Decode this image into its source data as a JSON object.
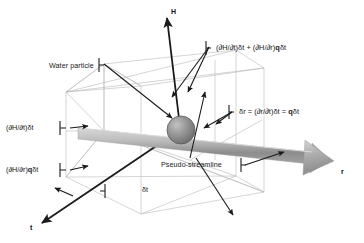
{
  "figure": {
    "background_color": "#ffffff",
    "line_color_dark": "#1a1a1a",
    "line_color_light": "#b9b9b9",
    "particle_color": "#8f8f8f",
    "arrow_color": "#a8a8a8"
  },
  "axes": [
    {
      "name": "H",
      "label": "H",
      "direction": "up"
    },
    {
      "name": "r",
      "label": "r",
      "direction": "right"
    },
    {
      "name": "t",
      "label": "t",
      "direction": "down-left"
    }
  ],
  "labels": {
    "water_particle": "Water particle",
    "pseudo_streamline": "Pseudo-streamline",
    "delta_t": "δt",
    "dh_dt": "(∂H/∂t)δt",
    "dh_dr_q": "(∂H/∂r)qδt",
    "dh_dr_q_prefix": "(∂H/∂r)",
    "dh_dr_q_bold": "q",
    "dh_dr_q_suffix": "δt",
    "total_head_change_part1": "(∂H/∂t)δt + (∂H/∂r)",
    "total_head_change_bold": "q",
    "total_head_change_part2": "δt",
    "total_head_change_full": "(∂H/∂t)δt + (∂H/∂r)qδt",
    "delta_r_part1": "δr = (∂r/∂t)δt = ",
    "delta_r_bold": "q",
    "delta_r_part2": "δt",
    "delta_r_full": "δr = (∂r/∂t)δt = qδt"
  },
  "axis_labels": {
    "h": "H",
    "r": "r",
    "t": "t"
  }
}
